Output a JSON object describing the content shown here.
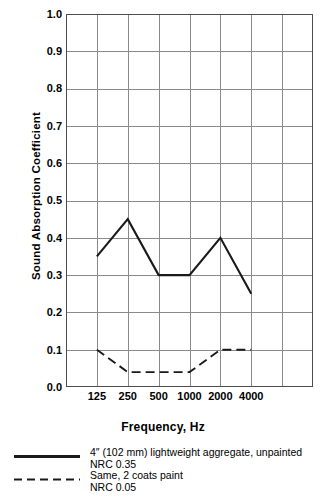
{
  "chart_data": {
    "type": "line",
    "title": "",
    "xlabel": "Frequency, Hz",
    "ylabel": "Sound Absorption Coefficient",
    "categories": [
      "125",
      "250",
      "500",
      "1000",
      "2000",
      "4000"
    ],
    "x_tick_labels": [
      "125",
      "250",
      "500",
      "1000",
      "2000",
      "4000"
    ],
    "y_tick_labels": [
      "1.0",
      "0.9",
      "0.8",
      "0.7",
      "0.6",
      "0.5",
      "0.4",
      "0.3",
      "0.2",
      "0.1",
      "0.0"
    ],
    "ylim": [
      0.0,
      1.0
    ],
    "y_major_step": 0.1,
    "grid": true,
    "legend_position": "below-axes-left",
    "series": [
      {
        "name": "4″ (102 mm) lightweight aggregate, unpainted",
        "style": "solid",
        "color": "#1a1a1a",
        "nrc_label": "NRC 0.35",
        "nrc": 0.35,
        "values": [
          0.35,
          0.45,
          0.3,
          0.3,
          0.4,
          0.25
        ]
      },
      {
        "name": "Same, 2 coats paint",
        "style": "dashed",
        "color": "#1a1a1a",
        "nrc_label": "NRC 0.05",
        "nrc": 0.05,
        "values": [
          0.1,
          0.04,
          0.04,
          0.04,
          0.1,
          0.1
        ]
      }
    ]
  },
  "axes": {
    "y_title": "Sound Absorption Coefficient",
    "x_title": "Frequency, Hz"
  },
  "legend": {
    "entries": [
      {
        "label": "4″ (102 mm) lightweight aggregate, unpainted",
        "sublabel": "NRC 0.35",
        "style": "solid"
      },
      {
        "label": "Same, 2 coats paint",
        "sublabel": "NRC 0.05",
        "style": "dashed"
      }
    ]
  },
  "colors": {
    "line": "#1a1a1a",
    "grid": "#8a8a8a",
    "axis": "#4d4d4d",
    "background": "#ffffff"
  }
}
